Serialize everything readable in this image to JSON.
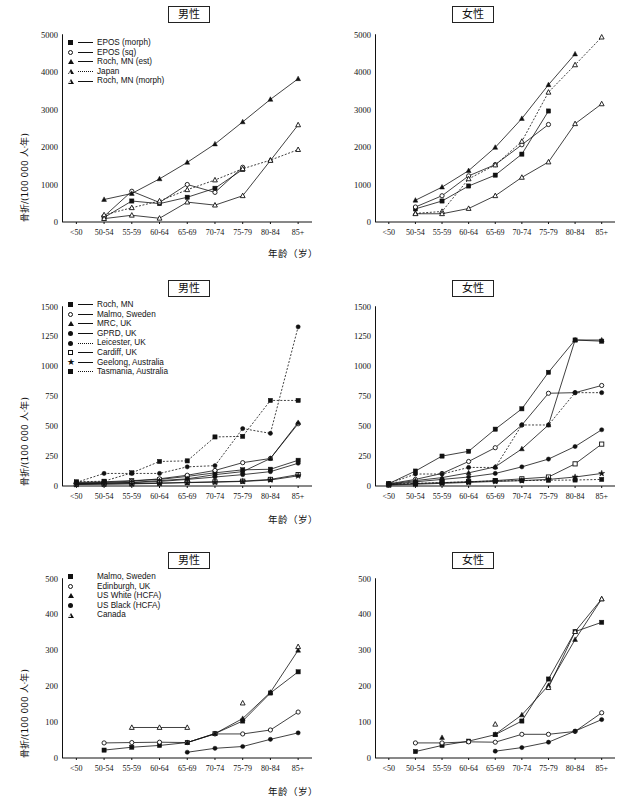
{
  "figure": {
    "axis_x_label": "年龄（岁）",
    "axis_y_label": "骨折/(100 000 人·年)",
    "title_male": "男性",
    "title_female": "女性",
    "categories": [
      "<50",
      "50-54",
      "55-59",
      "60-64",
      "65-69",
      "70-74",
      "75-79",
      "80-84",
      "85+"
    ]
  },
  "chart_data": [
    {
      "id": "row1-male",
      "type": "line",
      "title": "男性",
      "xlabel": "年龄（岁）",
      "ylabel": "骨折/(100 000 人·年)",
      "categories": [
        "<50",
        "50-54",
        "55-59",
        "60-64",
        "65-69",
        "70-74",
        "75-79",
        "80-84",
        "85+"
      ],
      "ylim": [
        0,
        5000
      ],
      "yticks": [
        0,
        1000,
        2000,
        3000,
        4000,
        5000
      ],
      "grid": false,
      "legend_position": "top-left",
      "series": [
        {
          "name": "EPOS (morph)",
          "marker": "filled-square",
          "line": "solid",
          "values": [
            null,
            120,
            560,
            490,
            660,
            900,
            1400,
            null,
            null
          ]
        },
        {
          "name": "EPOS (sq)",
          "marker": "open-circle",
          "line": "solid",
          "values": [
            null,
            150,
            820,
            520,
            1000,
            790,
            1460,
            null,
            null
          ]
        },
        {
          "name": "Roch, MN (est)",
          "marker": "filled-triangle",
          "line": "solid",
          "values": [
            null,
            600,
            760,
            1150,
            1590,
            2080,
            2670,
            3270,
            3820
          ]
        },
        {
          "name": "Japan",
          "marker": "open-triangle",
          "line": "dotted",
          "values": [
            null,
            190,
            380,
            560,
            860,
            1120,
            1420,
            1650,
            1930
          ]
        },
        {
          "name": "Roch, MN (morph)",
          "marker": "open-triangle",
          "line": "solid",
          "values": [
            null,
            90,
            180,
            100,
            530,
            450,
            700,
            1640,
            2590
          ]
        }
      ]
    },
    {
      "id": "row1-female",
      "type": "line",
      "title": "女性",
      "xlabel": "年龄（岁）",
      "ylabel": "骨折/(100 000 人·年)",
      "categories": [
        "<50",
        "50-54",
        "55-59",
        "60-64",
        "65-69",
        "70-74",
        "75-79",
        "80-84",
        "85+"
      ],
      "ylim": [
        0,
        5000
      ],
      "yticks": [
        0,
        1000,
        2000,
        3000,
        4000,
        5000
      ],
      "grid": false,
      "legend_position": "none",
      "series": [
        {
          "name": "EPOS (morph)",
          "marker": "filled-square",
          "line": "solid",
          "values": [
            null,
            350,
            560,
            960,
            1250,
            1810,
            2960,
            null,
            null
          ]
        },
        {
          "name": "EPOS (sq)",
          "marker": "open-circle",
          "line": "solid",
          "values": [
            null,
            400,
            700,
            1230,
            1530,
            2060,
            2600,
            null,
            null
          ]
        },
        {
          "name": "Roch, MN (est)",
          "marker": "filled-triangle",
          "line": "solid",
          "values": [
            null,
            580,
            930,
            1370,
            1990,
            2760,
            3660,
            4480,
            null
          ]
        },
        {
          "name": "Japan",
          "marker": "open-triangle",
          "line": "dotted",
          "values": [
            null,
            230,
            280,
            1150,
            1520,
            2150,
            3460,
            4190,
            4930
          ]
        },
        {
          "name": "Roch, MN (morph)",
          "marker": "open-triangle",
          "line": "solid",
          "values": [
            null,
            220,
            220,
            360,
            700,
            1190,
            1600,
            2620,
            3150
          ]
        }
      ]
    },
    {
      "id": "row2-male",
      "type": "line",
      "title": "男性",
      "xlabel": "年龄（岁）",
      "ylabel": "骨折/(100 000 人·年)",
      "categories": [
        "<50",
        "50-54",
        "55-59",
        "60-64",
        "65-69",
        "70-74",
        "75-79",
        "80-84",
        "85+"
      ],
      "ylim": [
        0,
        1500
      ],
      "yticks": [
        0,
        250,
        500,
        750,
        1000,
        1250,
        1500
      ],
      "grid": false,
      "legend_position": "top-left",
      "series": [
        {
          "name": "Roch, MN",
          "marker": "filled-square",
          "line": "solid",
          "values": [
            30,
            35,
            45,
            55,
            80,
            110,
            135,
            140,
            215
          ]
        },
        {
          "name": "Malmo, Sweden",
          "marker": "open-circle",
          "line": "solid",
          "values": [
            25,
            30,
            40,
            60,
            90,
            130,
            195,
            230,
            520
          ]
        },
        {
          "name": "MRC, UK",
          "marker": "filled-triangle",
          "line": "solid",
          "values": [
            20,
            25,
            30,
            45,
            60,
            95,
            120,
            230,
            530
          ]
        },
        {
          "name": "GPRD, UK",
          "marker": "filled-circle",
          "line": "solid",
          "values": [
            18,
            22,
            28,
            38,
            55,
            75,
            95,
            120,
            190
          ]
        },
        {
          "name": "Leicester, UK",
          "marker": "filled-circle",
          "line": "dotted",
          "values": [
            30,
            105,
            105,
            105,
            160,
            170,
            480,
            440,
            1330
          ]
        },
        {
          "name": "Cardiff, UK",
          "marker": "open-square",
          "line": "solid",
          "values": [
            15,
            18,
            20,
            25,
            30,
            35,
            40,
            55,
            95
          ]
        },
        {
          "name": "Geelong, Australia",
          "marker": "star",
          "line": "solid",
          "values": [
            12,
            15,
            18,
            22,
            28,
            32,
            38,
            50,
            85
          ]
        },
        {
          "name": "Tasmania, Australia",
          "marker": "filled-square",
          "line": "dotted",
          "values": [
            35,
            40,
            110,
            205,
            210,
            410,
            415,
            715,
            715
          ]
        }
      ]
    },
    {
      "id": "row2-female",
      "type": "line",
      "title": "女性",
      "xlabel": "年龄（岁）",
      "ylabel": "骨折/(100 000 人·年)",
      "categories": [
        "<50",
        "50-54",
        "55-59",
        "60-64",
        "65-69",
        "70-74",
        "75-79",
        "80-84",
        "85+"
      ],
      "ylim": [
        0,
        1500
      ],
      "yticks": [
        0,
        250,
        500,
        750,
        1000,
        1250,
        1500
      ],
      "grid": false,
      "legend_position": "none",
      "series": [
        {
          "name": "Roch, MN",
          "marker": "filled-square",
          "line": "solid",
          "values": [
            20,
            125,
            250,
            290,
            475,
            645,
            950,
            1220,
            1210
          ]
        },
        {
          "name": "Malmo, Sweden",
          "marker": "open-circle",
          "line": "solid",
          "values": [
            18,
            55,
            105,
            205,
            320,
            510,
            775,
            780,
            840
          ]
        },
        {
          "name": "MRC, UK",
          "marker": "filled-triangle",
          "line": "solid",
          "values": [
            15,
            45,
            70,
            110,
            160,
            310,
            510,
            1220,
            1220
          ]
        },
        {
          "name": "GPRD, UK",
          "marker": "filled-circle",
          "line": "solid",
          "values": [
            12,
            35,
            55,
            75,
            105,
            160,
            225,
            330,
            470
          ]
        },
        {
          "name": "Leicester, UK",
          "marker": "filled-circle",
          "line": "dotted",
          "values": [
            20,
            100,
            100,
            155,
            155,
            510,
            510,
            780,
            780
          ]
        },
        {
          "name": "Cardiff, UK",
          "marker": "open-square",
          "line": "solid",
          "values": [
            10,
            20,
            28,
            35,
            45,
            60,
            75,
            185,
            350
          ]
        },
        {
          "name": "Geelong, Australia",
          "marker": "star",
          "line": "solid",
          "values": [
            8,
            15,
            22,
            30,
            38,
            45,
            55,
            75,
            105
          ]
        },
        {
          "name": "Tasmania, Australia",
          "marker": "filled-square",
          "line": "dotted",
          "values": [
            15,
            22,
            28,
            35,
            42,
            45,
            48,
            50,
            55
          ]
        }
      ]
    },
    {
      "id": "row3-male",
      "type": "line",
      "title": "男性",
      "xlabel": "年龄（岁）",
      "ylabel": "骨折/(100 000 人·年)",
      "categories": [
        "<50",
        "50-54",
        "55-59",
        "60-64",
        "65-69",
        "70-74",
        "75-79",
        "80-84",
        "85+"
      ],
      "ylim": [
        0,
        500
      ],
      "yticks": [
        0,
        100,
        200,
        300,
        400,
        500
      ],
      "grid": false,
      "legend_position": "top-left",
      "series": [
        {
          "name": "Malmo, Sweden",
          "marker": "filled-square",
          "line": "solid",
          "values": [
            null,
            22,
            30,
            35,
            43,
            68,
            103,
            181,
            240
          ]
        },
        {
          "name": "Edinburgh, UK",
          "marker": "open-circle",
          "line": "solid",
          "values": [
            null,
            42,
            43,
            44,
            43,
            67,
            67,
            78,
            128
          ]
        },
        {
          "name": "US White (HCFA)",
          "marker": "filled-triangle",
          "line": "solid",
          "values": [
            null,
            null,
            null,
            null,
            43,
            68,
            110,
            183,
            300
          ]
        },
        {
          "name": "US Black (HCFA)",
          "marker": "filled-circle",
          "line": "solid",
          "values": [
            null,
            null,
            null,
            null,
            16,
            27,
            32,
            52,
            70
          ]
        },
        {
          "name": "Canada",
          "marker": "open-triangle",
          "line": "solid",
          "values": [
            null,
            null,
            85,
            85,
            85,
            null,
            153,
            null,
            310
          ]
        }
      ]
    },
    {
      "id": "row3-female",
      "type": "line",
      "title": "女性",
      "xlabel": "年龄（岁）",
      "ylabel": "骨折/(100 000 人·年)",
      "categories": [
        "<50",
        "50-54",
        "55-59",
        "60-64",
        "65-69",
        "70-74",
        "75-79",
        "80-84",
        "85+"
      ],
      "ylim": [
        0,
        500
      ],
      "yticks": [
        0,
        100,
        200,
        300,
        400,
        500
      ],
      "grid": false,
      "legend_position": "none",
      "series": [
        {
          "name": "Malmo, Sweden",
          "marker": "filled-square",
          "line": "solid",
          "values": [
            null,
            18,
            35,
            47,
            65,
            103,
            220,
            352,
            378
          ]
        },
        {
          "name": "Edinburgh, UK",
          "marker": "open-circle",
          "line": "solid",
          "values": [
            null,
            42,
            42,
            45,
            44,
            66,
            66,
            74,
            126
          ]
        },
        {
          "name": "US White (HCFA)",
          "marker": "filled-triangle",
          "line": "solid",
          "values": [
            null,
            null,
            57,
            null,
            66,
            120,
            202,
            330,
            443
          ]
        },
        {
          "name": "US Black (HCFA)",
          "marker": "filled-circle",
          "line": "solid",
          "values": [
            null,
            null,
            null,
            null,
            19,
            29,
            44,
            75,
            107
          ]
        },
        {
          "name": "Canada",
          "marker": "open-triangle",
          "line": "solid",
          "values": [
            null,
            null,
            null,
            null,
            94,
            null,
            196,
            352,
            443
          ]
        }
      ]
    }
  ],
  "legends": [
    {
      "id": "legend-row1",
      "items": [
        {
          "label": "EPOS (morph)",
          "marker": "filled-square",
          "line": "solid"
        },
        {
          "label": "EPOS (sq)",
          "marker": "open-circle",
          "line": "solid"
        },
        {
          "label": "Roch, MN (est)",
          "marker": "filled-triangle",
          "line": "solid"
        },
        {
          "label": "Japan",
          "marker": "open-triangle",
          "line": "dotted"
        },
        {
          "label": "Roch, MN (morph)",
          "marker": "open-triangle",
          "line": "solid"
        }
      ]
    },
    {
      "id": "legend-row2",
      "items": [
        {
          "label": "Roch, MN",
          "marker": "filled-square",
          "line": "solid"
        },
        {
          "label": "Malmo, Sweden",
          "marker": "open-circle",
          "line": "solid"
        },
        {
          "label": "MRC, UK",
          "marker": "filled-triangle",
          "line": "solid"
        },
        {
          "label": "GPRD, UK",
          "marker": "filled-circle",
          "line": "solid"
        },
        {
          "label": "Leicester, UK",
          "marker": "filled-circle",
          "line": "dotted"
        },
        {
          "label": "Cardiff, UK",
          "marker": "open-square",
          "line": "solid"
        },
        {
          "label": "Geelong, Australia",
          "marker": "star",
          "line": "solid"
        },
        {
          "label": "Tasmania, Australia",
          "marker": "filled-square",
          "line": "dotted"
        }
      ]
    },
    {
      "id": "legend-row3",
      "items": [
        {
          "label": "Malmo, Sweden",
          "marker": "filled-square",
          "line": "none"
        },
        {
          "label": "Edinburgh, UK",
          "marker": "open-circle",
          "line": "none"
        },
        {
          "label": "US White (HCFA)",
          "marker": "filled-triangle",
          "line": "none"
        },
        {
          "label": "US Black (HCFA)",
          "marker": "filled-circle",
          "line": "none"
        },
        {
          "label": "Canada",
          "marker": "open-triangle",
          "line": "none"
        }
      ]
    }
  ]
}
